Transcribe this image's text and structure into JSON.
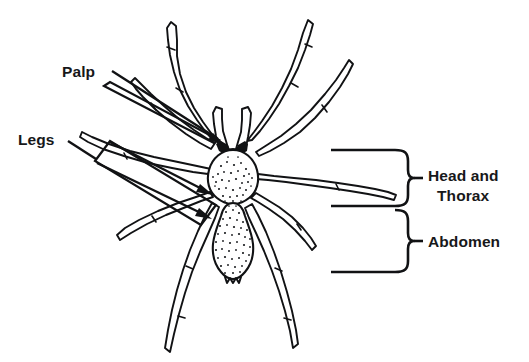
{
  "figure": {
    "background_color": "#ffffff",
    "ink_color": "#111214",
    "text_color": "#17181a",
    "width": 529,
    "height": 362
  },
  "labels": {
    "palp": {
      "text": "Palp",
      "x": 62,
      "y": 77,
      "anchor": "start",
      "pointer": "elongated-tapered-pointer",
      "points_to": "pedipalp"
    },
    "legs": {
      "text": "Legs",
      "x": 18,
      "y": 145,
      "anchor": "start",
      "pointer": "parallelogram-bracket-with-two-arrows",
      "points_to": "walking-legs"
    },
    "head_and_thorax": {
      "line1": "Head and",
      "line2": "Thorax",
      "x": 428,
      "y": 181,
      "anchor": "start",
      "pointer": "curly-brace-right",
      "points_to": "cephalothorax"
    },
    "abdomen": {
      "text": "Abdomen",
      "x": 428,
      "y": 243,
      "anchor": "start",
      "pointer": "curly-brace-right",
      "points_to": "abdomen"
    }
  },
  "anatomy": {
    "parts": [
      {
        "name": "cephalothorax",
        "common_name": "Head and Thorax",
        "texture": "stippled"
      },
      {
        "name": "abdomen",
        "common_name": "Abdomen",
        "texture": "stippled"
      },
      {
        "name": "pedipalp",
        "common_name": "Palp",
        "count": 2
      },
      {
        "name": "walking-leg",
        "common_name": "Legs",
        "count": 8
      },
      {
        "name": "eyes",
        "common_name": "Eyes",
        "count": 2
      },
      {
        "name": "spinnerets",
        "common_name": "Spinnerets"
      }
    ]
  },
  "braces": {
    "upper": {
      "label_key": "head_and_thorax",
      "top_y": 149,
      "bottom_y": 204,
      "x": 408
    },
    "lower": {
      "label_key": "abdomen",
      "top_y": 208,
      "bottom_y": 268,
      "x": 408
    }
  }
}
